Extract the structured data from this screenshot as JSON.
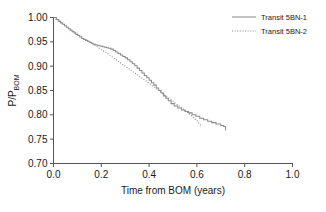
{
  "chart_data": {
    "type": "line",
    "title": "",
    "xlabel": "Time from BOM (years)",
    "ylabel": "P/P",
    "ylabel_sub": "BOM",
    "xlim": [
      0.0,
      1.0
    ],
    "ylim": [
      0.7,
      1.0
    ],
    "xticks": [
      "0.0",
      "0.2",
      "0.4",
      "0.6",
      "0.8",
      "1.0"
    ],
    "xtick_values": [
      0.0,
      0.2,
      0.4,
      0.6,
      0.8,
      1.0
    ],
    "yticks": [
      "0.70",
      "0.75",
      "0.80",
      "0.85",
      "0.90",
      "0.95",
      "1.00"
    ],
    "ytick_values": [
      0.7,
      0.75,
      0.8,
      0.85,
      0.9,
      0.95,
      1.0
    ],
    "grid": false,
    "legend_position": "top-right",
    "series": [
      {
        "name": "Transit 5BN-1",
        "style": "solid",
        "drawstyle": "steps-post",
        "color": "#8c8c8c",
        "x": [
          0.0,
          0.012,
          0.022,
          0.03,
          0.038,
          0.046,
          0.054,
          0.062,
          0.07,
          0.078,
          0.086,
          0.094,
          0.102,
          0.11,
          0.118,
          0.126,
          0.134,
          0.142,
          0.15,
          0.158,
          0.166,
          0.174,
          0.182,
          0.19,
          0.198,
          0.206,
          0.214,
          0.222,
          0.23,
          0.24,
          0.25,
          0.26,
          0.27,
          0.28,
          0.29,
          0.3,
          0.31,
          0.32,
          0.33,
          0.34,
          0.35,
          0.36,
          0.37,
          0.38,
          0.39,
          0.4,
          0.41,
          0.42,
          0.43,
          0.44,
          0.45,
          0.46,
          0.47,
          0.48,
          0.492,
          0.505,
          0.52,
          0.535,
          0.55,
          0.565,
          0.58,
          0.596,
          0.612,
          0.628,
          0.645,
          0.662,
          0.68,
          0.7,
          0.712,
          0.72
        ],
        "y": [
          1.0,
          0.996,
          0.992,
          0.989,
          0.986,
          0.983,
          0.98,
          0.977,
          0.974,
          0.971,
          0.968,
          0.965,
          0.963,
          0.96,
          0.957,
          0.955,
          0.953,
          0.951,
          0.949,
          0.947,
          0.945,
          0.944,
          0.943,
          0.942,
          0.941,
          0.94,
          0.939,
          0.938,
          0.937,
          0.935,
          0.932,
          0.929,
          0.926,
          0.923,
          0.92,
          0.917,
          0.913,
          0.909,
          0.905,
          0.901,
          0.896,
          0.891,
          0.886,
          0.881,
          0.876,
          0.871,
          0.866,
          0.861,
          0.855,
          0.85,
          0.845,
          0.839,
          0.834,
          0.829,
          0.823,
          0.818,
          0.814,
          0.81,
          0.807,
          0.804,
          0.8,
          0.797,
          0.793,
          0.79,
          0.787,
          0.784,
          0.781,
          0.778,
          0.776,
          0.768
        ]
      },
      {
        "name": "Transit 5BN-2",
        "style": "dotted",
        "drawstyle": "default",
        "color": "#8c8c8c",
        "x": [
          0.0,
          0.02,
          0.04,
          0.06,
          0.08,
          0.1,
          0.12,
          0.14,
          0.16,
          0.18,
          0.2,
          0.22,
          0.24,
          0.26,
          0.28,
          0.3,
          0.32,
          0.34,
          0.36,
          0.38,
          0.4,
          0.42,
          0.44,
          0.46,
          0.48,
          0.5,
          0.52,
          0.54,
          0.56,
          0.58,
          0.6,
          0.62
        ],
        "y": [
          1.0,
          0.993,
          0.986,
          0.979,
          0.972,
          0.966,
          0.959,
          0.953,
          0.947,
          0.941,
          0.934,
          0.928,
          0.921,
          0.914,
          0.907,
          0.9,
          0.893,
          0.886,
          0.879,
          0.872,
          0.865,
          0.857,
          0.85,
          0.843,
          0.835,
          0.828,
          0.82,
          0.813,
          0.805,
          0.797,
          0.788,
          0.776
        ]
      }
    ]
  },
  "legend": {
    "items": [
      {
        "label": "Transit 5BN-1",
        "style": "solid"
      },
      {
        "label": "Transit 5BN-2",
        "style": "dotted"
      }
    ]
  }
}
